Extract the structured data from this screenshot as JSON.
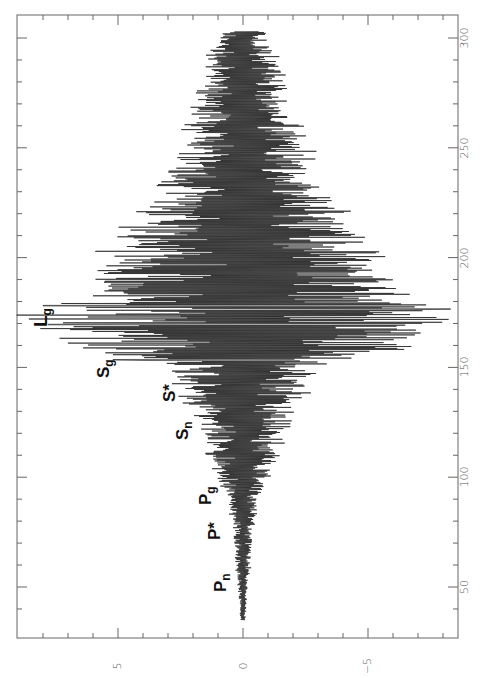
{
  "chart_data": {
    "type": "line",
    "title": "",
    "orientation": "rotated 90 degrees: time axis vertical on right, amplitude axis horizontal at bottom (positive to the left)",
    "xlabel": "",
    "ylabel": "",
    "time_axis": {
      "range": [
        30,
        305
      ],
      "ticks": [
        50,
        100,
        150,
        200,
        250,
        300
      ],
      "tick_labels": [
        "50",
        "100",
        "150",
        "200",
        "250",
        "300"
      ],
      "minor_step": 10
    },
    "amplitude_axis": {
      "range": [
        8.5,
        -8.5
      ],
      "ticks": [
        5,
        0,
        -5
      ],
      "tick_labels": [
        "5",
        "0",
        "−5"
      ],
      "minor_step": 1
    },
    "grid": false,
    "legend": null,
    "series": [
      {
        "name": "seismogram",
        "color": "#222222",
        "envelope": {
          "time": [
            35,
            50,
            60,
            75,
            90,
            100,
            110,
            120,
            130,
            140,
            150,
            155,
            160,
            165,
            170,
            175,
            180,
            190,
            200,
            210,
            220,
            230,
            240,
            250,
            260,
            270,
            280,
            290,
            300,
            303
          ],
          "amplitude": [
            0.1,
            0.2,
            0.3,
            0.4,
            0.6,
            1.0,
            1.4,
            1.8,
            2.0,
            2.6,
            3.0,
            5.0,
            6.5,
            7.5,
            8.3,
            8.5,
            6.5,
            5.8,
            5.6,
            4.8,
            4.0,
            3.4,
            2.8,
            2.6,
            2.2,
            1.9,
            1.6,
            1.4,
            1.0,
            0.8
          ]
        }
      }
    ],
    "annotations": [
      {
        "text": "P",
        "sub": "n",
        "time": 55,
        "amplitude": 1.0
      },
      {
        "text": "P*",
        "sub": "",
        "time": 77,
        "amplitude": 1.2
      },
      {
        "text": "P",
        "sub": "g",
        "time": 93,
        "amplitude": 1.6
      },
      {
        "text": "S",
        "sub": "n",
        "time": 120,
        "amplitude": 2.6
      },
      {
        "text": "S*",
        "sub": "",
        "time": 140,
        "amplitude": 3.3
      },
      {
        "text": "S",
        "sub": "g",
        "time": 153,
        "amplitude": 5.5
      },
      {
        "text": "L",
        "sub": "g",
        "time": 175,
        "amplitude": 8.0
      }
    ]
  },
  "labels": {
    "Pn": {
      "main": "P",
      "sub": "n"
    },
    "Pstar": {
      "main": "P*"
    },
    "Pg": {
      "main": "P",
      "sub": "g"
    },
    "Sn": {
      "main": "S",
      "sub": "n"
    },
    "Sstar": {
      "main": "S*"
    },
    "Sg": {
      "main": "S",
      "sub": "g"
    },
    "Lg": {
      "main": "L",
      "sub": "g"
    }
  },
  "axes": {
    "time_ticks": [
      "50",
      "100",
      "150",
      "200",
      "250",
      "300"
    ],
    "amp_ticks": [
      "5",
      "0",
      "−5"
    ]
  }
}
